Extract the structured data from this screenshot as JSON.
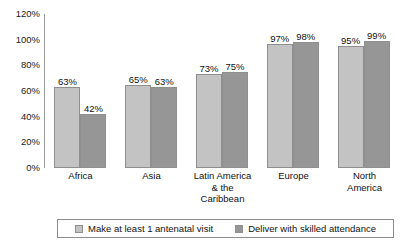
{
  "chart_data": {
    "type": "bar",
    "title": "",
    "xlabel": "",
    "ylabel": "",
    "ylim": [
      0,
      120
    ],
    "ytick_labels": [
      "120%",
      "100%",
      "80%",
      "60%",
      "40%",
      "20%",
      "0%"
    ],
    "ytick_values": [
      120,
      100,
      80,
      60,
      40,
      20,
      0
    ],
    "grid": false,
    "legend_position": "bottom",
    "categories": [
      "Africa",
      "Asia",
      "Latin America & the Caribbean",
      "Europe",
      "North America"
    ],
    "category_lines": [
      [
        "Africa"
      ],
      [
        "Asia"
      ],
      [
        "Latin America",
        "& the",
        "Caribbean"
      ],
      [
        "Europe"
      ],
      [
        "North",
        "America"
      ]
    ],
    "series": [
      {
        "name": "Make at least 1 antenatal visit",
        "color": "#c3c3c3",
        "values": [
          63,
          65,
          73,
          97,
          95
        ],
        "labels": [
          "63%",
          "65%",
          "73%",
          "97%",
          "95%"
        ]
      },
      {
        "name": "Deliver with skilled attendance",
        "color": "#969696",
        "values": [
          42,
          63,
          75,
          98,
          99
        ],
        "labels": [
          "42%",
          "63%",
          "75%",
          "98%",
          "99%"
        ]
      }
    ]
  },
  "legend": {
    "items": [
      {
        "label": "Make at least 1 antenatal visit"
      },
      {
        "label": "Deliver with skilled attendance"
      }
    ]
  }
}
